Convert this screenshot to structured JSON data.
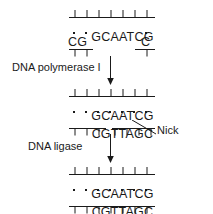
{
  "figure": {
    "ink_color": "#1a1a1a",
    "background_color": "#ffffff"
  },
  "steps": [
    {
      "id": "step-1",
      "name": "gapped-duplex",
      "top_strand": "GCAATCG",
      "bottom_segments": [
        {
          "text": "CG",
          "aligned_under": "GC"
        },
        {
          "text": "C",
          "aligned_under": "G"
        }
      ],
      "base_pair_dots": 3,
      "top_rail_ticks": 7,
      "bottom_rail_left_ticks": 2,
      "bottom_rail_right_ticks": 1,
      "has_gap": true
    },
    {
      "id": "step-2",
      "name": "nicked-duplex",
      "top_strand": "GCAATCG",
      "bottom_strand": "CGTTAGC",
      "base_pair_dots": 7,
      "top_rail_ticks": 7,
      "bottom_rail_ticks": 7,
      "has_nick": true,
      "nick_after_base": 3
    },
    {
      "id": "step-3",
      "name": "sealed-duplex",
      "top_strand": "GCAATCG",
      "bottom_strand": "CGTTAGC",
      "base_pair_dots": 7,
      "top_rail_ticks": 7,
      "bottom_rail_ticks": 7,
      "has_nick": false
    }
  ],
  "reactions": [
    {
      "id": "reaction-1",
      "label": "DNA polymerase I",
      "arrow": "down-arrow"
    },
    {
      "id": "reaction-2",
      "label": "DNA ligase",
      "arrow": "down-arrow"
    }
  ],
  "annotations": [
    {
      "id": "nick-annotation",
      "label": "Nick",
      "leader": "diagonal-line"
    }
  ]
}
